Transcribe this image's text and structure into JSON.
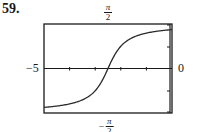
{
  "problem_number": "59.",
  "labels": {
    "y_max": {
      "numerator": "π",
      "denominator": "2",
      "sign": ""
    },
    "y_min": {
      "numerator": "π",
      "denominator": "2",
      "sign": "−"
    },
    "x_min": "−5",
    "x_max": "0"
  },
  "colors": {
    "frame": "#1a1a1a",
    "curve": "#2a2a2a",
    "background": "#ffffff"
  },
  "chart_data": {
    "type": "line",
    "title": "",
    "xlabel": "",
    "ylabel": "",
    "xlim": [
      -5,
      0
    ],
    "ylim": [
      -1.5708,
      1.5708
    ],
    "x_tick_labels": [
      "−5",
      "0"
    ],
    "y_tick_labels": [
      "−π/2",
      "π/2"
    ],
    "x_ticks": [
      -4,
      -3,
      -2,
      -1
    ],
    "grid": false,
    "legend": null,
    "series": [
      {
        "name": "y = arctan(2x + 5)",
        "x": [
          -5,
          -4.5,
          -4,
          -3.5,
          -3,
          -2.75,
          -2.5,
          -2.25,
          -2,
          -1.5,
          -1,
          -0.5,
          0
        ],
        "y": [
          -1.373,
          -1.326,
          -1.249,
          -1.107,
          -0.785,
          -0.464,
          0,
          0.464,
          0.785,
          1.107,
          1.249,
          1.326,
          1.373
        ]
      }
    ],
    "annotations": [
      "59."
    ]
  }
}
